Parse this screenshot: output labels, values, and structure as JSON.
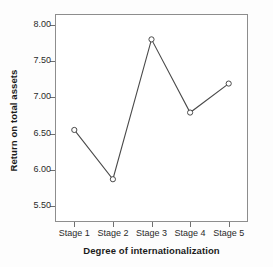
{
  "chart_data": {
    "type": "line",
    "title": "",
    "xlabel": "Degree of internationalization",
    "ylabel": "Return on total assets",
    "categories": [
      "Stage 1",
      "Stage 2",
      "Stage 3",
      "Stage 4",
      "Stage 5"
    ],
    "values": [
      6.55,
      5.87,
      7.8,
      6.79,
      7.19
    ],
    "series": [
      {
        "name": "Return on total assets",
        "values": [
          6.55,
          5.87,
          7.8,
          6.79,
          7.19
        ]
      }
    ],
    "ylim": [
      5.28,
      8.15
    ],
    "yticks": [
      5.5,
      6.0,
      6.5,
      7.0,
      7.5,
      8.0
    ],
    "ytick_labels": [
      "5.50",
      "6.00",
      "6.50",
      "7.00",
      "7.50",
      "8.00"
    ],
    "grid": false,
    "legend": "none",
    "marker": "open-circle",
    "line_color": "#4a4a4a",
    "marker_color": "#4a4a4a",
    "frame_color": "#8d8d8d",
    "background_color": "#ffffff"
  }
}
